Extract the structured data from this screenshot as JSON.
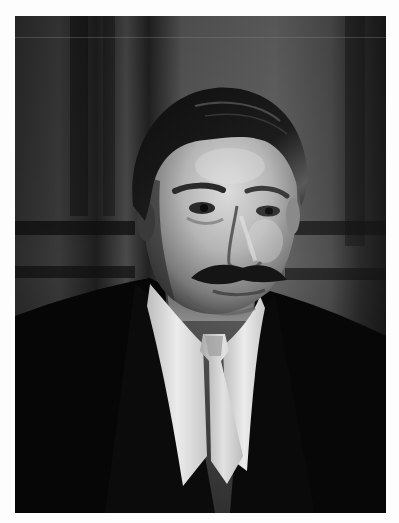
{
  "image": {
    "description": "Black-and-white studio portrait photograph of a man with dark slicked-back hair and a thick mustache, wearing a dark suit jacket, white high-collared shirt and light-colored tie, in front of dark wood-paneled wall",
    "palette": {
      "background_page": "#fdfdfd",
      "panel_dark": "#1c1c1c",
      "panel_mid": "#4a4a4a",
      "panel_light": "#6e6e6e",
      "hair": "#141414",
      "skin_light": "#d8d8d8",
      "skin_mid": "#9a9a9a",
      "skin_shadow": "#4e4e4e",
      "shirt": "#e6e6e6",
      "tie": "#cfcfcf",
      "suit": "#080808"
    }
  }
}
